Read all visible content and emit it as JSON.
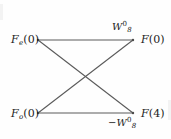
{
  "figure": {
    "kind": "fft-butterfly-signal-flow-graph",
    "width": 171,
    "height": 139,
    "background_color": "#fefefe",
    "line_color": "#4a4a4a",
    "text_color": "#1c1c1c"
  },
  "nodes": {
    "input_top": {
      "name": "F_e(0)",
      "base": "F",
      "sub": "e",
      "arg": "(0)",
      "x": 38,
      "y": 40
    },
    "input_bottom": {
      "name": "F_o(0)",
      "base": "F",
      "sub": "o",
      "arg": "(0)",
      "x": 38,
      "y": 113
    },
    "output_top": {
      "name": "F(0)",
      "base": "F",
      "sub": "",
      "arg": "(0)",
      "x": 133,
      "y": 40
    },
    "output_bottom": {
      "name": "F(4)",
      "base": "F",
      "sub": "",
      "arg": "(4)",
      "x": 133,
      "y": 113
    }
  },
  "edges": [
    {
      "id": "top-straight",
      "from": "input_top",
      "to": "output_top",
      "label_id": "twiddle_top"
    },
    {
      "id": "bottom-straight",
      "from": "input_bottom",
      "to": "output_bottom",
      "label_id": "twiddle_bottom"
    },
    {
      "id": "cross-down",
      "from": "input_top",
      "to": "output_bottom",
      "label_id": null
    },
    {
      "id": "cross-up",
      "from": "input_bottom",
      "to": "output_top",
      "label_id": null
    }
  ],
  "crossing_point": {
    "x": 86,
    "y": 77
  },
  "labels": {
    "twiddle_top": {
      "sign": "",
      "base": "W",
      "sub": "8",
      "sup": "0",
      "text": "W_8^0"
    },
    "twiddle_bottom": {
      "sign": "−",
      "base": "W",
      "sub": "8",
      "sup": "0",
      "text": "-W_8^0"
    }
  }
}
